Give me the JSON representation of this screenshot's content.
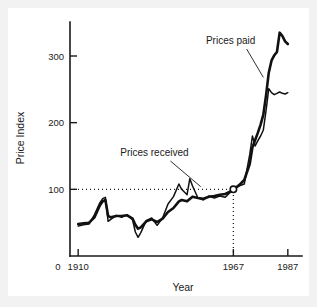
{
  "chart_data": {
    "type": "line",
    "title": "",
    "xlabel": "Year",
    "ylabel": "Price Index",
    "xlim": [
      1907,
      1990
    ],
    "ylim": [
      0,
      345
    ],
    "grid": false,
    "legend_position": "inline-annotations",
    "x_ticks": [
      {
        "value": 1910,
        "label": "1910"
      },
      {
        "value": 1967,
        "label": "1967"
      },
      {
        "value": 1987,
        "label": "1987"
      }
    ],
    "x_origin_label": "0",
    "y_ticks": [
      {
        "value": 100,
        "label": "100"
      },
      {
        "value": 200,
        "label": "200"
      },
      {
        "value": 300,
        "label": "300"
      }
    ],
    "reference_lines": [
      {
        "name": "index-100-horizontal",
        "orientation": "horizontal",
        "value": 100,
        "from_x": 1907,
        "to_x": 1967,
        "style": "dotted"
      },
      {
        "name": "year-1967-vertical",
        "orientation": "vertical",
        "value": 1967,
        "from_y": 0,
        "to_y": 100,
        "style": "dotted"
      }
    ],
    "markers": [
      {
        "name": "base-year-point",
        "x": 1967,
        "y": 100,
        "style": "open-circle"
      }
    ],
    "annotations": [
      {
        "name": "prices-paid-annotation",
        "text": "Prices paid",
        "text_x": 1966,
        "text_y": 318,
        "point_x": 1978,
        "point_y": 268
      },
      {
        "name": "prices-received-annotation",
        "text": "Prices received",
        "text_x": 1938,
        "text_y": 150,
        "point_x": 1955,
        "point_y": 104
      }
    ],
    "series": [
      {
        "name": "Prices paid",
        "x": [
          1910,
          1912,
          1914,
          1916,
          1918,
          1919,
          1920,
          1921,
          1922,
          1924,
          1926,
          1928,
          1930,
          1931,
          1932,
          1933,
          1935,
          1937,
          1939,
          1941,
          1943,
          1945,
          1947,
          1948,
          1950,
          1952,
          1954,
          1956,
          1958,
          1960,
          1962,
          1964,
          1966,
          1967,
          1969,
          1971,
          1973,
          1974,
          1975,
          1976,
          1977,
          1978,
          1979,
          1980,
          1981,
          1982,
          1983,
          1984,
          1985,
          1986,
          1987
        ],
        "values": [
          48,
          49,
          50,
          58,
          76,
          82,
          84,
          60,
          58,
          60,
          60,
          61,
          56,
          47,
          41,
          43,
          52,
          55,
          51,
          56,
          66,
          72,
          82,
          84,
          82,
          89,
          87,
          86,
          89,
          90,
          92,
          93,
          97,
          100,
          106,
          114,
          138,
          163,
          174,
          185,
          197,
          212,
          241,
          275,
          293,
          301,
          306,
          335,
          330,
          322,
          318
        ]
      },
      {
        "name": "Prices received",
        "x": [
          1910,
          1912,
          1914,
          1916,
          1918,
          1919,
          1920,
          1921,
          1922,
          1924,
          1926,
          1928,
          1930,
          1931,
          1932,
          1933,
          1935,
          1937,
          1939,
          1941,
          1943,
          1945,
          1947,
          1948,
          1950,
          1951,
          1952,
          1954,
          1956,
          1958,
          1960,
          1962,
          1964,
          1966,
          1967,
          1969,
          1971,
          1973,
          1974,
          1975,
          1976,
          1977,
          1978,
          1979,
          1980,
          1981,
          1982,
          1983,
          1984,
          1985,
          1986,
          1987
        ],
        "values": [
          45,
          47,
          48,
          62,
          80,
          86,
          88,
          52,
          55,
          61,
          58,
          62,
          54,
          36,
          28,
          35,
          53,
          57,
          46,
          57,
          78,
          89,
          108,
          100,
          92,
          116,
          105,
          87,
          84,
          90,
          87,
          90,
          88,
          96,
          100,
          105,
          108,
          152,
          180,
          165,
          173,
          180,
          189,
          218,
          251,
          245,
          242,
          244,
          246,
          244,
          243,
          245
        ]
      }
    ]
  },
  "figure": {
    "background": "#f2f2f2",
    "panel_background": "#ffffff",
    "line_color": "#111111"
  }
}
